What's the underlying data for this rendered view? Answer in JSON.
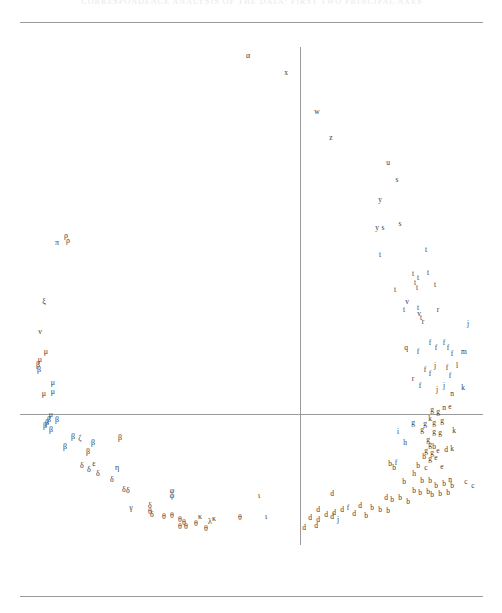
{
  "figure": {
    "header_text": "CORRESPONDENCE ANALYSIS OF THE DATA: FIRST TWO PRINCIPAL AXES",
    "top_rule": "top-rule",
    "bottom_rule": "bottom-rule"
  },
  "chart_data": {
    "type": "scatter",
    "title": "CORRESPONDENCE ANALYSIS OF THE DATA: FIRST TWO PRINCIPAL AXES",
    "xlabel": "",
    "ylabel": "",
    "xlim": [
      0,
      463
    ],
    "ylim": [
      0,
      540
    ],
    "grid": false,
    "legend": "none",
    "axis_origin": {
      "x": 280,
      "y": 384
    },
    "axis_horizontal": {
      "x0": 0,
      "x1": 463,
      "y": 384
    },
    "axis_vertical": {
      "y0": 17,
      "y1": 515,
      "x": 280
    },
    "note": "Point markers are plotted as their category letter labels; Greek letters form the left/lower branch and Latin letters the right/upper branch of a horseshoe (Guttman effect) arc.",
    "marker_style": "text-label",
    "series": [
      {
        "name": "greek-labels",
        "alphabet": "greek",
        "points": [
          {
            "label": "α",
            "x": 228,
            "y": 26
          },
          {
            "label": "π",
            "x": 37,
            "y": 213
          },
          {
            "label": "ρ",
            "x": 46,
            "y": 206
          },
          {
            "label": "ρ",
            "x": 48,
            "y": 211
          },
          {
            "label": "ξ",
            "x": 24,
            "y": 272
          },
          {
            "label": "ν",
            "x": 20,
            "y": 302
          },
          {
            "label": "μ",
            "x": 26,
            "y": 322
          },
          {
            "label": "μ",
            "x": 20,
            "y": 330
          },
          {
            "label": "β",
            "x": 18,
            "y": 335
          },
          {
            "label": "β",
            "x": 19,
            "y": 340
          },
          {
            "label": "μ",
            "x": 33,
            "y": 353
          },
          {
            "label": "μ",
            "x": 24,
            "y": 364
          },
          {
            "label": "μ",
            "x": 33,
            "y": 362
          },
          {
            "label": "μ",
            "x": 31,
            "y": 385
          },
          {
            "label": "β",
            "x": 29,
            "y": 390
          },
          {
            "label": "β",
            "x": 27,
            "y": 393
          },
          {
            "label": "β",
            "x": 25,
            "y": 396
          },
          {
            "label": "β",
            "x": 37,
            "y": 390
          },
          {
            "label": "β",
            "x": 31,
            "y": 400
          },
          {
            "label": "β",
            "x": 53,
            "y": 407
          },
          {
            "label": "ζ",
            "x": 60,
            "y": 409
          },
          {
            "label": "β",
            "x": 45,
            "y": 417
          },
          {
            "label": "β",
            "x": 73,
            "y": 413
          },
          {
            "label": "β",
            "x": 68,
            "y": 422
          },
          {
            "label": "β",
            "x": 100,
            "y": 408
          },
          {
            "label": "δ",
            "x": 62,
            "y": 436
          },
          {
            "label": "δ",
            "x": 69,
            "y": 440
          },
          {
            "label": "ε",
            "x": 74,
            "y": 434
          },
          {
            "label": "δ",
            "x": 78,
            "y": 444
          },
          {
            "label": "η",
            "x": 97,
            "y": 438
          },
          {
            "label": "δ",
            "x": 92,
            "y": 450
          },
          {
            "label": "δ",
            "x": 104,
            "y": 460
          },
          {
            "label": "δ",
            "x": 108,
            "y": 461
          },
          {
            "label": "φ",
            "x": 152,
            "y": 461
          },
          {
            "label": "φ",
            "x": 152,
            "y": 466
          },
          {
            "label": "γ",
            "x": 111,
            "y": 478
          },
          {
            "label": "δ",
            "x": 130,
            "y": 476
          },
          {
            "label": "θ",
            "x": 130,
            "y": 482
          },
          {
            "label": "δ",
            "x": 132,
            "y": 485
          },
          {
            "label": "θ",
            "x": 144,
            "y": 487
          },
          {
            "label": "θ",
            "x": 152,
            "y": 486
          },
          {
            "label": "θ",
            "x": 160,
            "y": 490
          },
          {
            "label": "θ",
            "x": 164,
            "y": 493
          },
          {
            "label": "θ",
            "x": 160,
            "y": 497
          },
          {
            "label": "θ",
            "x": 166,
            "y": 497
          },
          {
            "label": "κ",
            "x": 180,
            "y": 487
          },
          {
            "label": "θ",
            "x": 176,
            "y": 494
          },
          {
            "label": "κ",
            "x": 194,
            "y": 489
          },
          {
            "label": "λ",
            "x": 190,
            "y": 492
          },
          {
            "label": "θ",
            "x": 186,
            "y": 499
          },
          {
            "label": "θ",
            "x": 220,
            "y": 488
          },
          {
            "label": "ι",
            "x": 246,
            "y": 487
          },
          {
            "label": "ι",
            "x": 239,
            "y": 466
          }
        ]
      },
      {
        "name": "latin-labels",
        "alphabet": "latin",
        "points": [
          {
            "label": "x",
            "x": 266,
            "y": 43
          },
          {
            "label": "w",
            "x": 297,
            "y": 82
          },
          {
            "label": "z",
            "x": 311,
            "y": 108
          },
          {
            "label": "u",
            "x": 368,
            "y": 133
          },
          {
            "label": "s",
            "x": 377,
            "y": 150
          },
          {
            "label": "y",
            "x": 360,
            "y": 170
          },
          {
            "label": "y",
            "x": 357,
            "y": 198
          },
          {
            "label": "s",
            "x": 363,
            "y": 198
          },
          {
            "label": "s",
            "x": 380,
            "y": 194
          },
          {
            "label": "t",
            "x": 360,
            "y": 225
          },
          {
            "label": "t",
            "x": 406,
            "y": 220
          },
          {
            "label": "t",
            "x": 393,
            "y": 244
          },
          {
            "label": "t",
            "x": 398,
            "y": 248
          },
          {
            "label": "t",
            "x": 408,
            "y": 243
          },
          {
            "label": "t",
            "x": 415,
            "y": 255
          },
          {
            "label": "t",
            "x": 375,
            "y": 260
          },
          {
            "label": "t",
            "x": 395,
            "y": 253
          },
          {
            "label": "t",
            "x": 397,
            "y": 258
          },
          {
            "label": "v",
            "x": 387,
            "y": 272
          },
          {
            "label": "t",
            "x": 384,
            "y": 280
          },
          {
            "label": "t",
            "x": 398,
            "y": 278
          },
          {
            "label": "r",
            "x": 418,
            "y": 280
          },
          {
            "label": "v",
            "x": 399,
            "y": 284
          },
          {
            "label": "t",
            "x": 401,
            "y": 288
          },
          {
            "label": "r",
            "x": 403,
            "y": 292
          },
          {
            "label": "j",
            "x": 448,
            "y": 294
          },
          {
            "label": "q",
            "x": 386,
            "y": 318
          },
          {
            "label": "f",
            "x": 398,
            "y": 322
          },
          {
            "label": "f",
            "x": 410,
            "y": 313
          },
          {
            "label": "f",
            "x": 416,
            "y": 318
          },
          {
            "label": "f",
            "x": 424,
            "y": 313
          },
          {
            "label": "f",
            "x": 428,
            "y": 318
          },
          {
            "label": "f",
            "x": 432,
            "y": 324
          },
          {
            "label": "m",
            "x": 444,
            "y": 322
          },
          {
            "label": "f",
            "x": 405,
            "y": 340
          },
          {
            "label": "f",
            "x": 410,
            "y": 344
          },
          {
            "label": "j",
            "x": 415,
            "y": 336
          },
          {
            "label": "f",
            "x": 427,
            "y": 338
          },
          {
            "label": "l",
            "x": 437,
            "y": 336
          },
          {
            "label": "r",
            "x": 393,
            "y": 349
          },
          {
            "label": "f",
            "x": 400,
            "y": 356
          },
          {
            "label": "f",
            "x": 430,
            "y": 346
          },
          {
            "label": "j",
            "x": 417,
            "y": 360
          },
          {
            "label": "j",
            "x": 424,
            "y": 356
          },
          {
            "label": "n",
            "x": 432,
            "y": 364
          },
          {
            "label": "k",
            "x": 443,
            "y": 358
          },
          {
            "label": "n",
            "x": 424,
            "y": 378
          },
          {
            "label": "g",
            "x": 412,
            "y": 380
          },
          {
            "label": "g",
            "x": 418,
            "y": 382
          },
          {
            "label": "e",
            "x": 430,
            "y": 377
          },
          {
            "label": "g",
            "x": 393,
            "y": 393
          },
          {
            "label": "k",
            "x": 410,
            "y": 389
          },
          {
            "label": "g",
            "x": 405,
            "y": 394
          },
          {
            "label": "g",
            "x": 414,
            "y": 393
          },
          {
            "label": "g",
            "x": 422,
            "y": 391
          },
          {
            "label": "i",
            "x": 378,
            "y": 402
          },
          {
            "label": "g",
            "x": 402,
            "y": 400
          },
          {
            "label": "g",
            "x": 414,
            "y": 402
          },
          {
            "label": "g",
            "x": 420,
            "y": 403
          },
          {
            "label": "k",
            "x": 434,
            "y": 401
          },
          {
            "label": "h",
            "x": 385,
            "y": 413
          },
          {
            "label": "g",
            "x": 408,
            "y": 410
          },
          {
            "label": "g",
            "x": 410,
            "y": 415
          },
          {
            "label": "b",
            "x": 414,
            "y": 417
          },
          {
            "label": "g",
            "x": 406,
            "y": 421
          },
          {
            "label": "g",
            "x": 412,
            "y": 423
          },
          {
            "label": "e",
            "x": 418,
            "y": 421
          },
          {
            "label": "d",
            "x": 426,
            "y": 420
          },
          {
            "label": "k",
            "x": 432,
            "y": 419
          },
          {
            "label": "b",
            "x": 404,
            "y": 427
          },
          {
            "label": "g",
            "x": 410,
            "y": 429
          },
          {
            "label": "e",
            "x": 416,
            "y": 428
          },
          {
            "label": "b",
            "x": 370,
            "y": 434
          },
          {
            "label": "b",
            "x": 374,
            "y": 438
          },
          {
            "label": "f",
            "x": 376,
            "y": 433
          },
          {
            "label": "b",
            "x": 398,
            "y": 436
          },
          {
            "label": "c",
            "x": 406,
            "y": 438
          },
          {
            "label": "e",
            "x": 422,
            "y": 437
          },
          {
            "label": "h",
            "x": 394,
            "y": 444
          },
          {
            "label": "n",
            "x": 430,
            "y": 450
          },
          {
            "label": "b",
            "x": 384,
            "y": 452
          },
          {
            "label": "b",
            "x": 402,
            "y": 451
          },
          {
            "label": "b",
            "x": 410,
            "y": 451
          },
          {
            "label": "c",
            "x": 446,
            "y": 452
          },
          {
            "label": "c",
            "x": 453,
            "y": 456
          },
          {
            "label": "b",
            "x": 416,
            "y": 456
          },
          {
            "label": "b",
            "x": 424,
            "y": 454
          },
          {
            "label": "b",
            "x": 432,
            "y": 456
          },
          {
            "label": "d",
            "x": 312,
            "y": 464
          },
          {
            "label": "b",
            "x": 394,
            "y": 461
          },
          {
            "label": "b",
            "x": 400,
            "y": 463
          },
          {
            "label": "b",
            "x": 408,
            "y": 462
          },
          {
            "label": "b",
            "x": 412,
            "y": 465
          },
          {
            "label": "b",
            "x": 420,
            "y": 464
          },
          {
            "label": "b",
            "x": 428,
            "y": 463
          },
          {
            "label": "d",
            "x": 366,
            "y": 468
          },
          {
            "label": "b",
            "x": 372,
            "y": 470
          },
          {
            "label": "b",
            "x": 380,
            "y": 468
          },
          {
            "label": "b",
            "x": 388,
            "y": 472
          },
          {
            "label": "d",
            "x": 298,
            "y": 480
          },
          {
            "label": "d",
            "x": 306,
            "y": 485
          },
          {
            "label": "d",
            "x": 314,
            "y": 483
          },
          {
            "label": "d",
            "x": 322,
            "y": 480
          },
          {
            "label": "f",
            "x": 328,
            "y": 478
          },
          {
            "label": "d",
            "x": 340,
            "y": 476
          },
          {
            "label": "b",
            "x": 352,
            "y": 478
          },
          {
            "label": "b",
            "x": 360,
            "y": 480
          },
          {
            "label": "b",
            "x": 368,
            "y": 481
          },
          {
            "label": "d",
            "x": 290,
            "y": 488
          },
          {
            "label": "d",
            "x": 298,
            "y": 490
          },
          {
            "label": "d",
            "x": 312,
            "y": 487
          },
          {
            "label": "j",
            "x": 318,
            "y": 490
          },
          {
            "label": "d",
            "x": 334,
            "y": 484
          },
          {
            "label": "b",
            "x": 346,
            "y": 486
          },
          {
            "label": "d",
            "x": 284,
            "y": 498
          },
          {
            "label": "d",
            "x": 296,
            "y": 496
          }
        ]
      }
    ]
  }
}
